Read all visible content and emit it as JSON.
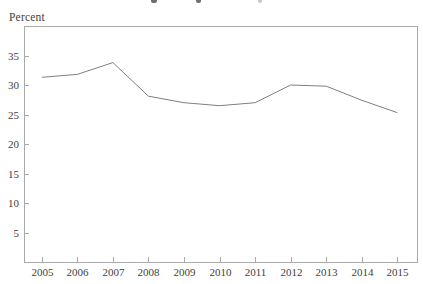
{
  "window": {
    "width": 423,
    "height": 284
  },
  "chart_data": {
    "type": "line",
    "title": "",
    "title_note": "title cropped out of frame; only letter descender fragments visible at top edge",
    "ylabel": "Percent",
    "xlabel": "",
    "categories": [
      "2005",
      "2006",
      "2007",
      "2008",
      "2009",
      "2010",
      "2011",
      "2012",
      "2013",
      "2014",
      "2015"
    ],
    "values": [
      31.3,
      31.8,
      33.8,
      28.1,
      27.0,
      26.5,
      27.0,
      30.0,
      29.8,
      27.4,
      25.3
    ],
    "yticks": [
      5,
      10,
      15,
      20,
      25,
      30,
      35
    ],
    "ylim": [
      0,
      40
    ],
    "xlim": [
      2004.5,
      2015.55
    ],
    "grid": false,
    "legend": "none",
    "colors": {
      "line": "#7f7f7f",
      "axis": "#aaaaaa",
      "text": "#45413a",
      "background": "#ffffff"
    }
  }
}
